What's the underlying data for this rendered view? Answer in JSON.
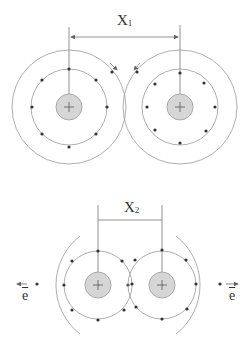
{
  "diagram": {
    "top_panel": {
      "distance_label": {
        "main": "X",
        "sub": "1"
      },
      "atoms": [
        {
          "center": [
            69,
            107
          ],
          "nucleus_r": 13,
          "inner_orbit_r": 38,
          "outer_orbit_r": 57,
          "inner_electrons": 8,
          "outer_electrons": 1
        },
        {
          "center": [
            180,
            107
          ],
          "nucleus_r": 13,
          "inner_orbit_r": 38,
          "outer_orbit_r": 57,
          "inner_electrons": 8,
          "outer_electrons": 1
        }
      ]
    },
    "bottom_panel": {
      "distance_label": {
        "main": "X",
        "sub": "2"
      },
      "atoms": [
        {
          "center": [
            98,
            285
          ],
          "nucleus_r": 13,
          "inner_orbit_r": 34,
          "outer_arc_r": 62,
          "inner_electrons": 8
        },
        {
          "center": [
            162,
            285
          ],
          "nucleus_r": 13,
          "inner_orbit_r": 34,
          "outer_arc_r": 62,
          "inner_electrons": 8
        }
      ],
      "electron_labels": [
        "e",
        "e"
      ]
    },
    "colors": {
      "line": "#888888",
      "nucleus_fill": "#d6d6d6",
      "nucleus_stroke": "#9a9a9a",
      "electron": "#333333"
    }
  }
}
